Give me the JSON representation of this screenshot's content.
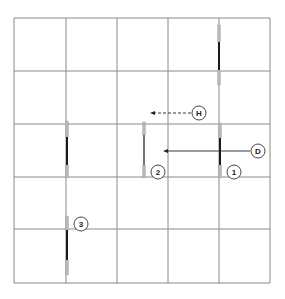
{
  "diagram": {
    "grid": {
      "x_lines": [
        14,
        66,
        117,
        168,
        219,
        270
      ],
      "y_lines": [
        18,
        71,
        124,
        177,
        229,
        283
      ],
      "color": "#8a8a8a"
    },
    "elements": [
      {
        "id": "top-right",
        "x": 219,
        "gray_top": [
          25,
          42
        ],
        "black": [
          42,
          70
        ],
        "gray_bottom": [
          70,
          85
        ]
      },
      {
        "id": "left-mid",
        "x": 67,
        "gray_top": [
          121,
          137
        ],
        "black": [
          137,
          165
        ],
        "gray_bottom": [
          165,
          178
        ]
      },
      {
        "id": "center-2",
        "x": 144,
        "gray_top": [
          122,
          135
        ],
        "black": [
          135,
          165
        ],
        "gray_bottom": [
          165,
          178
        ],
        "thin": true
      },
      {
        "id": "right-1",
        "x": 220,
        "gray_top": [
          123,
          138
        ],
        "black": [
          138,
          165
        ],
        "gray_bottom": [
          165,
          178
        ]
      },
      {
        "id": "bottom-3",
        "x": 67,
        "gray_top": [
          216,
          230
        ],
        "black": [
          230,
          260
        ],
        "gray_bottom": [
          260,
          275
        ]
      }
    ],
    "labels": [
      {
        "text": "H",
        "cx": 199,
        "cy": 113
      },
      {
        "text": "D",
        "cx": 258,
        "cy": 151
      },
      {
        "text": "1",
        "cx": 234,
        "cy": 172
      },
      {
        "text": "2",
        "cx": 158,
        "cy": 172
      },
      {
        "text": "3",
        "cx": 81,
        "cy": 224
      }
    ],
    "arrows": [
      {
        "name": "arrow-h",
        "x1": 191,
        "y1": 113,
        "x2": 150,
        "y2": 113,
        "dashed": true
      },
      {
        "name": "arrow-d",
        "x1": 250,
        "y1": 151,
        "x2": 163,
        "y2": 151,
        "dashed": false
      }
    ],
    "colors": {
      "gray": "#b8b8b8",
      "black": "#1a1a1a",
      "label_stroke": "#333333"
    }
  }
}
